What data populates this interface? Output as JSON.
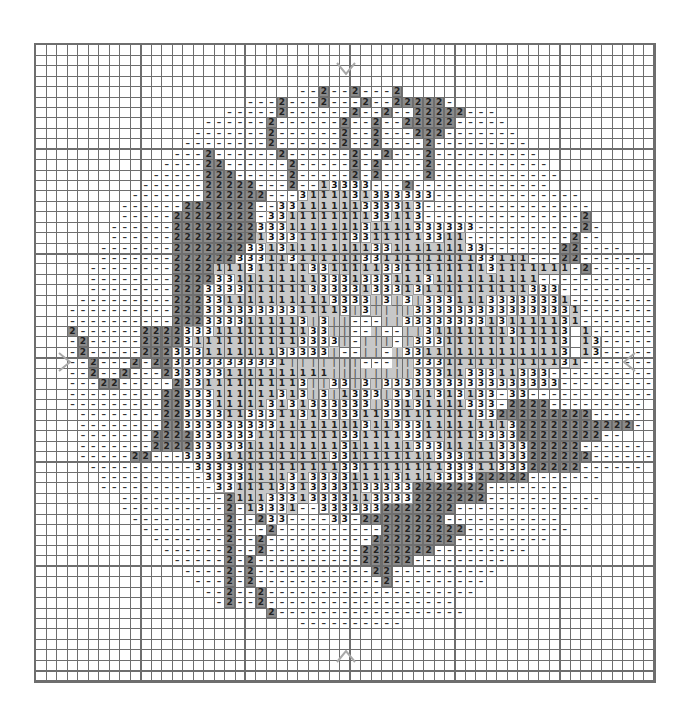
{
  "chart": {
    "cols": 59,
    "rows": 61,
    "major_grid_every": 10,
    "legend": {
      ".": "empty",
      "-": "dash",
      "2": "dark-gray",
      "3": "three",
      "1": "light-gray",
      "|": "bar"
    },
    "colors": {
      "grid": "#6e6e6e",
      "dark": "#6e6e6e",
      "light": "#c8c8c8",
      "white": "#ffffff",
      "marker": "#a8a8a8"
    },
    "center_markers": [
      "top",
      "bottom",
      "left",
      "right"
    ],
    "grid_rows": [
      "...........................................................",
      "...........................................................",
      "...........................................................",
      "...........................................................",
      ".........................--2--2---2........................",
      "....................---2---2---2--22222-...................",
      "..................-----2------2--2--22222---...............",
      "................------2------2--2--22222-----..............",
      "...............-------2------2--2---222-------.............",
      "..............--------2------2--2----2---------............",
      ".............---2------2------2--2---2----------...........",
      "............----22------2-----2-2----2-----------..........",
      "...........-----222-----2-----2-2----2------------.........",
      "..........------22222---2--13333---2-------------..........",
      ".........-------222222---3111131333333--------------.......",
      "........------2222222--33111111333313----------------......",
      "........-----22222222-331111111133113---------------2......",
      ".......------22222222333111111131111333333----------2-.....",
      ".......------2222222213331111133111113311----------2--.....",
      "......-------222222233131111111133111111133-------22----...",
      "......-------2222223331131111113311111111133111---22------.",
      ".....--------22221113111113311111331111111131111111-2------",
      ".....--------22223311111111333133311131111111111------------",
      ".....--------2223333111111333331333131111111111333-------...",
      "....---------2223311111111113333|3|3|33311133333331--------",
      "...----------22233333333311113|3||||3333333333333331-------",
      "...----------2223333111113|3||---||33333333131111131-------",
      "...2------222233311111111133||--|--||31111111311113 1------",
      "...-2-----2222311111111113333|-|||-|333111111111113 13-----",
      "...-2-----222333111111133333|--||-|3311111111111113 13-----",
      "...--2---2-2233333333331|||||||---||3331111111111131-------",
      "...--2--2---2333331111111111||||||||3331133311333----------",
      "...---22-----2331111111113||33|3|33333333333333333---------",
      "...---------22333111111313|3|1333|3311313133-33------------",
      "...---------22333111113131333333|33131111333-2222---------.",
      "....--------22333311333113133331133111111133222222222-----.",
      "....--------223333333331111111131133311111111322222222222-.",
      "....-------2222333333111111113311113311111333322222222--...",
      "....-------22223333311111111131111113331111133322222------.",
      "....-----22---333311111111113311111111333111333222222------",
      ".....----------3333311111111133111111113331133322222------.",
      "......----------3333111131333311113111333322222-------.....",
      "......-----------33111133133331333332222222--------........",
      "........----------2111333133331133332222222-----------.....",
      "........----------2-13331--3333332222222-------------......",
      ".........---------2--233----33-22222222-----------.........",
      "..........--------2---2----------22222222----------........",
      "...........-------2--2----------22222222---------..........",
      "............------2--2---------2222222---------............",
      ".............-----2-2----------22222---------..............",
      "..............----2-2-----------22----------...............",
      "...............---2-2------------2---------................",
      "................--2--2--------------------.................",
      ".................-2--2------------------...................",
      "......................2------------------..................",
      ".........................----------........................",
      "...........................................................",
      "...........................................................",
      "...........................................................",
      "...........................................................",
      "..........................................................."
    ]
  }
}
